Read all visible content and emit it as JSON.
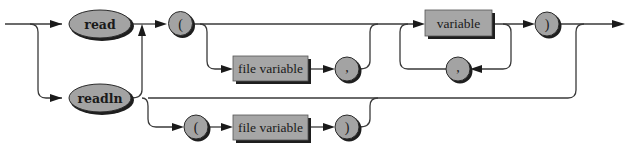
{
  "diagram": {
    "type": "syntax-diagram",
    "colors": {
      "line": "#3a3a3a",
      "node_fill": "#a3a3a3",
      "shadow": "#1e1e1e",
      "background": "#ffffff"
    },
    "nodes": {
      "read": {
        "kind": "keyword",
        "label": "read"
      },
      "readln": {
        "kind": "keyword",
        "label": "readln"
      },
      "open_paren_1": {
        "kind": "symbol",
        "label": "("
      },
      "file_variable_1": {
        "kind": "nonterminal",
        "label": "file variable"
      },
      "comma_1": {
        "kind": "symbol",
        "label": ","
      },
      "variable": {
        "kind": "nonterminal",
        "label": "variable"
      },
      "comma_2": {
        "kind": "symbol",
        "label": ","
      },
      "close_paren_1": {
        "kind": "symbol",
        "label": ")"
      },
      "open_paren_2": {
        "kind": "symbol",
        "label": "("
      },
      "file_variable_2": {
        "kind": "nonterminal",
        "label": "file variable"
      },
      "close_paren_2": {
        "kind": "symbol",
        "label": ")"
      }
    },
    "edges": [
      [
        "entry",
        "read"
      ],
      [
        "entry",
        "readln"
      ],
      [
        "read",
        "open_paren_1"
      ],
      [
        "readln",
        "open_paren_1"
      ],
      [
        "open_paren_1",
        "variable"
      ],
      [
        "open_paren_1",
        "file_variable_1"
      ],
      [
        "file_variable_1",
        "comma_1"
      ],
      [
        "comma_1",
        "variable"
      ],
      [
        "variable",
        "close_paren_1"
      ],
      [
        "variable",
        "comma_2"
      ],
      [
        "comma_2",
        "variable"
      ],
      [
        "close_paren_1",
        "exit"
      ],
      [
        "readln",
        "exit"
      ],
      [
        "readln",
        "open_paren_2"
      ],
      [
        "open_paren_2",
        "file_variable_2"
      ],
      [
        "file_variable_2",
        "close_paren_2"
      ],
      [
        "close_paren_2",
        "exit"
      ]
    ]
  }
}
